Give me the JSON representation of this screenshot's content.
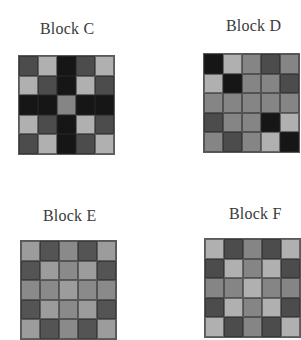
{
  "palette": {
    "K": "#161616",
    "D": "#4c4c4c",
    "M": "#858585",
    "L": "#b0b0b0",
    "EM": "#8a8a8a",
    "EL": "#9c9c9c",
    "ED": "#545454"
  },
  "blocks": [
    {
      "id": "C",
      "label": "Block C",
      "label_pos": [
        40,
        20
      ],
      "grid_pos": [
        18,
        55
      ],
      "grid_size": [
        97,
        100
      ],
      "cells": [
        [
          "D",
          "L",
          "K",
          "D",
          "L"
        ],
        [
          "L",
          "D",
          "K",
          "L",
          "D"
        ],
        [
          "K",
          "K",
          "M",
          "K",
          "K"
        ],
        [
          "L",
          "D",
          "K",
          "L",
          "D"
        ],
        [
          "D",
          "L",
          "K",
          "D",
          "L"
        ]
      ]
    },
    {
      "id": "D",
      "label": "Block D",
      "label_pos": [
        226,
        17
      ],
      "grid_pos": [
        203,
        53
      ],
      "grid_size": [
        97,
        100
      ],
      "cells": [
        [
          "K",
          "L",
          "M",
          "D",
          "M"
        ],
        [
          "L",
          "K",
          "M",
          "M",
          "D"
        ],
        [
          "M",
          "M",
          "M",
          "M",
          "M"
        ],
        [
          "D",
          "M",
          "M",
          "K",
          "L"
        ],
        [
          "M",
          "D",
          "M",
          "L",
          "K"
        ]
      ]
    },
    {
      "id": "E",
      "label": "Block E",
      "label_pos": [
        43,
        207
      ],
      "grid_pos": [
        20,
        240
      ],
      "grid_size": [
        97,
        100
      ],
      "cells": [
        [
          "EL",
          "ED",
          "EM",
          "ED",
          "EL"
        ],
        [
          "ED",
          "EL",
          "EM",
          "EL",
          "ED"
        ],
        [
          "EM",
          "EM",
          "EL",
          "EM",
          "EM"
        ],
        [
          "ED",
          "EL",
          "EM",
          "EL",
          "ED"
        ],
        [
          "EL",
          "ED",
          "EM",
          "ED",
          "EL"
        ]
      ]
    },
    {
      "id": "F",
      "label": "Block F",
      "label_pos": [
        229,
        205
      ],
      "grid_pos": [
        204,
        238
      ],
      "grid_size": [
        97,
        100
      ],
      "cells": [
        [
          "L",
          "D",
          "M",
          "D",
          "L"
        ],
        [
          "D",
          "L",
          "M",
          "L",
          "D"
        ],
        [
          "M",
          "M",
          "L",
          "M",
          "M"
        ],
        [
          "D",
          "L",
          "M",
          "L",
          "D"
        ],
        [
          "L",
          "D",
          "M",
          "D",
          "L"
        ]
      ]
    }
  ]
}
